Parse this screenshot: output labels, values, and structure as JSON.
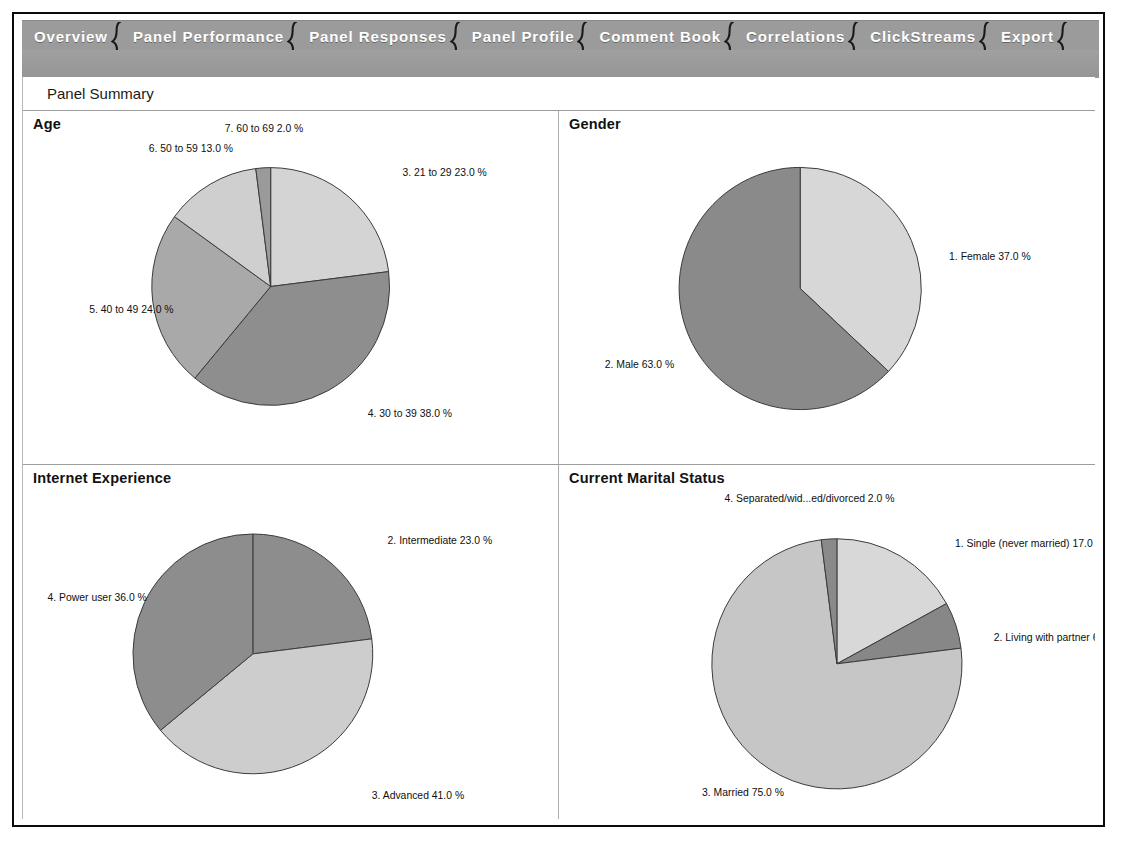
{
  "window": {
    "title": "Panel Summary"
  },
  "tabs": [
    {
      "label": "Overview",
      "active": true
    },
    {
      "label": "Panel Performance",
      "active": false
    },
    {
      "label": "Panel Responses",
      "active": false
    },
    {
      "label": "Panel Profile",
      "active": false
    },
    {
      "label": "Comment Book",
      "active": false
    },
    {
      "label": "Correlations",
      "active": false
    },
    {
      "label": "ClickStreams",
      "active": false
    },
    {
      "label": "Export",
      "active": false
    }
  ],
  "summary_bar": {
    "label": "Panel Summary"
  },
  "colors": {
    "tabbar_background": "#9b9b9b",
    "tab_text": "#ffffff",
    "panel_background": "#ffffff",
    "panel_border": "#adadad",
    "frame_border": "#0a0a0a",
    "pie_light": "#d4d4d4",
    "pie_medium_light": "#c3c3c3",
    "pie_medium": "#a8a8a8",
    "pie_dark": "#888888",
    "pie_darkest": "#7a7a7a",
    "pie_outline": "#3a3a3a"
  },
  "panels": [
    {
      "id": "age",
      "title": "Age"
    },
    {
      "id": "gender",
      "title": "Gender"
    },
    {
      "id": "internet_experience",
      "title": "Internet Experience"
    },
    {
      "id": "marital_status",
      "title": "Current Marital Status"
    }
  ],
  "chart_data": [
    {
      "id": "age",
      "type": "pie",
      "title": "Age",
      "start_angle_deg": 0,
      "direction": "clockwise",
      "legend": "labels-outside",
      "labels": [
        "3. 21 to 29 23.0 %",
        "4. 30 to 39 38.0 %",
        "5. 40 to 49 24.0 %",
        "6. 50 to 59 13.0 %",
        "7. 60 to 69 2.0 %"
      ],
      "categories": [
        "3. 21 to 29",
        "4. 30 to 39",
        "5. 40 to 49",
        "6. 50 to 59",
        "7. 60 to 69"
      ],
      "values": [
        23.0,
        38.0,
        24.0,
        13.0,
        2.0
      ],
      "unit": "%",
      "slice_colors": [
        "#d4d4d4",
        "#8e8e8e",
        "#a9a9a9",
        "#cfcfcf",
        "#9a9a9a"
      ]
    },
    {
      "id": "gender",
      "type": "pie",
      "title": "Gender",
      "start_angle_deg": 0,
      "direction": "clockwise",
      "legend": "labels-outside",
      "labels": [
        "1. Female 37.0 %",
        "2. Male 63.0 %"
      ],
      "categories": [
        "1. Female",
        "2. Male"
      ],
      "values": [
        37.0,
        63.0
      ],
      "unit": "%",
      "slice_colors": [
        "#d7d7d7",
        "#8a8a8a"
      ]
    },
    {
      "id": "internet_experience",
      "type": "pie",
      "title": "Internet Experience",
      "start_angle_deg": 0,
      "direction": "clockwise",
      "legend": "labels-outside",
      "labels": [
        "2. Intermediate 23.0 %",
        "3. Advanced 41.0 %",
        "4. Power user 36.0 %"
      ],
      "categories": [
        "2. Intermediate",
        "3. Advanced",
        "4. Power user"
      ],
      "values": [
        23.0,
        41.0,
        36.0
      ],
      "unit": "%",
      "slice_colors": [
        "#8d8d8d",
        "#cdcdcd",
        "#8d8d8d"
      ]
    },
    {
      "id": "marital_status",
      "type": "pie",
      "title": "Current Marital Status",
      "start_angle_deg": 0,
      "direction": "clockwise",
      "legend": "labels-outside",
      "labels": [
        "1. Single (never married) 17.0 %",
        "2. Living with partner 6.0",
        "3. Married 75.0 %",
        "4. Separated/wid...ed/divorced 2.0 %"
      ],
      "categories": [
        "1. Single (never married)",
        "2. Living with partner",
        "3. Married",
        "4. Separated/wid...ed/divorced"
      ],
      "values": [
        17.0,
        6.0,
        75.0,
        2.0
      ],
      "unit": "%",
      "slice_colors": [
        "#d8d8d8",
        "#878787",
        "#c6c6c6",
        "#8a8a8a"
      ]
    }
  ]
}
